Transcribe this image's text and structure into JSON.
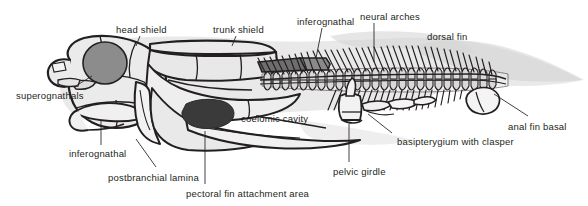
{
  "figure": {
    "background_color": "#ffffff",
    "ink_color": "#231f20",
    "plate_fill": "#ebebeb",
    "body_silhouette": "#dcdcdc",
    "orbit_fill": "#8c8c8c",
    "dark_patch_fill": "#3a3a3a",
    "vertebra_fill": "#d9d9d9"
  },
  "labels": [
    {
      "id": "head-shield",
      "text": "head shield",
      "x": 116,
      "y": 24
    },
    {
      "id": "trunk-shield",
      "text": "trunk shield",
      "x": 213,
      "y": 24
    },
    {
      "id": "inferognathal-top",
      "text": "inferognathal",
      "x": 297,
      "y": 16
    },
    {
      "id": "neural-arches",
      "text": "neural arches",
      "x": 360,
      "y": 11
    },
    {
      "id": "dorsal-fin",
      "text": "dorsal fin",
      "x": 427,
      "y": 31
    },
    {
      "id": "superognathals",
      "text": "superognathals",
      "x": 16,
      "y": 90
    },
    {
      "id": "coelomic-cavity",
      "text": "coelomic cavity",
      "x": 241,
      "y": 113
    },
    {
      "id": "anal-fin-basal",
      "text": "anal fin basal",
      "x": 508,
      "y": 121
    },
    {
      "id": "inferognathal-bottom",
      "text": "inferognathal",
      "x": 69,
      "y": 148
    },
    {
      "id": "basipterygium-with-clasper",
      "text": "basipterygium with clasper",
      "x": 397,
      "y": 136
    },
    {
      "id": "postbranchial-lamina",
      "text": "postbranchial lamina",
      "x": 108,
      "y": 172
    },
    {
      "id": "pelvic-girdle",
      "text": "pelvic girdle",
      "x": 333,
      "y": 166
    },
    {
      "id": "pectoral-fin-attachment",
      "text": "pectoral fin attachment area",
      "x": 186,
      "y": 188
    }
  ],
  "leader_lines": [
    {
      "id": "leader-head-shield",
      "points": "140,36 136,45"
    },
    {
      "id": "leader-trunk-shield",
      "points": "236,36 232,45"
    },
    {
      "id": "leader-inferognathal-top",
      "points": "322,28 316,58"
    },
    {
      "id": "leader-neural-arches",
      "points": "374,23 374,60"
    },
    {
      "id": "leader-superognathals",
      "points": "74,87 92,76"
    },
    {
      "id": "leader-anal-fin-basal",
      "points": "530,116 495,92"
    },
    {
      "id": "leader-inferognathal-bottom",
      "points": "101,145 101,121"
    },
    {
      "id": "leader-basipterygium",
      "points": "392,133 366,117"
    },
    {
      "id": "leader-postbranchial-lamina",
      "points": "156,167 136,139"
    },
    {
      "id": "leader-pelvic-girdle",
      "points": "349,162 349,123"
    },
    {
      "id": "leader-pectoral-attachment",
      "points": "205,184 205,131"
    }
  ],
  "anatomy_parts": [
    "head-shield",
    "orbit",
    "superognathals",
    "inferognathal",
    "postbranchial-lamina",
    "trunk-shield",
    "coelomic-cavity",
    "pectoral-fin-attachment-area",
    "vertebral-column",
    "neural-arches",
    "haemal-arches",
    "dorsal-fin",
    "pelvic-girdle",
    "basipterygium-with-clasper",
    "anal-fin-basal",
    "body-outline"
  ]
}
